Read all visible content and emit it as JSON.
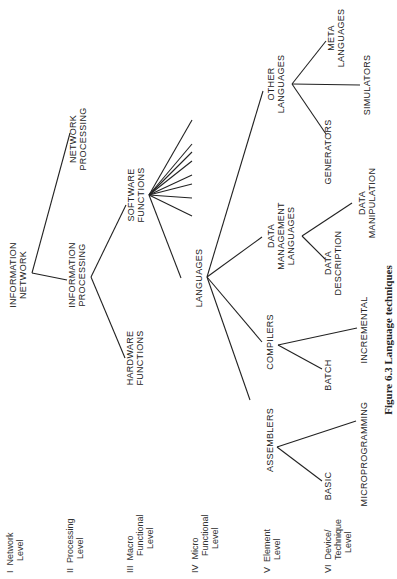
{
  "caption": "Figure 6.3 Language techniques",
  "levels": [
    {
      "numeral": "I",
      "lines": [
        "Network",
        "Level"
      ]
    },
    {
      "numeral": "II",
      "lines": [
        "Processing",
        "Level"
      ]
    },
    {
      "numeral": "III",
      "lines": [
        "Macro",
        "Functional",
        "Level"
      ]
    },
    {
      "numeral": "IV",
      "lines": [
        "Micro",
        "Functional",
        "Level"
      ]
    },
    {
      "numeral": "V",
      "lines": [
        "Element",
        "Level"
      ]
    },
    {
      "numeral": "VI",
      "lines": [
        "Device/",
        "Technique",
        "Level"
      ]
    }
  ],
  "nodes": {
    "information_network": [
      "INFORMATION",
      "NETWORK"
    ],
    "network_processing": [
      "NETWORK",
      "PROCESSING"
    ],
    "information_processing": [
      "INFORMATION",
      "PROCESSING"
    ],
    "hardware_functions": [
      "HARDWARE",
      "FUNCTIONS"
    ],
    "software_functions": [
      "SOFTWARE",
      "FUNCTIONS"
    ],
    "languages": [
      "LANGUAGES"
    ],
    "assemblers": [
      "ASSEMBLERS"
    ],
    "compilers": [
      "COMPILERS"
    ],
    "data_management_languages": [
      "DATA",
      "MANAGEMENT",
      "LANGUAGES"
    ],
    "other_languages": [
      "OTHER",
      "LANGUAGES"
    ],
    "basic": [
      "BASIC"
    ],
    "microprogramming": [
      "MICROPROGRAMMING"
    ],
    "batch": [
      "BATCH"
    ],
    "incremental": [
      "INCREMENTAL"
    ],
    "data_description": [
      "DATA",
      "DESCRIPTION"
    ],
    "data_manipulation": [
      "DATA",
      "MANIPULATION"
    ],
    "generators": [
      "GENERATORS"
    ],
    "simulators": [
      "SIMULATORS"
    ],
    "meta_languages": [
      "META",
      "LANGUAGES"
    ]
  },
  "tree": {
    "INFORMATION NETWORK": [
      "NETWORK PROCESSING",
      "INFORMATION PROCESSING"
    ],
    "INFORMATION PROCESSING": [
      "HARDWARE FUNCTIONS",
      "SOFTWARE FUNCTIONS"
    ],
    "SOFTWARE FUNCTIONS": [
      "LANGUAGES",
      "(8 unlabeled branches)"
    ],
    "LANGUAGES": [
      "ASSEMBLERS",
      "COMPILERS",
      "DATA MANAGEMENT LANGUAGES",
      "OTHER LANGUAGES"
    ],
    "ASSEMBLERS": [
      "BASIC",
      "MICROPROGRAMMING"
    ],
    "COMPILERS": [
      "BATCH",
      "INCREMENTAL"
    ],
    "DATA MANAGEMENT LANGUAGES": [
      "DATA DESCRIPTION",
      "DATA MANIPULATION"
    ],
    "OTHER LANGUAGES": [
      "GENERATORS",
      "SIMULATORS",
      "META LANGUAGES"
    ]
  },
  "orientation": "rotated 90° counter-clockwise"
}
